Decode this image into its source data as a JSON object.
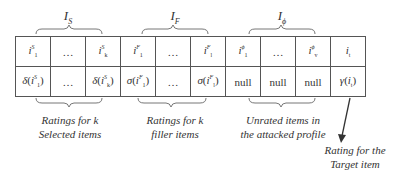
{
  "groups": {
    "selected": {
      "label_main": "I",
      "label_sub": "S"
    },
    "filler": {
      "label_main": "I",
      "label_sub": "F"
    },
    "unrated": {
      "label_main": "I",
      "label_sub": "ϕ"
    }
  },
  "table": {
    "row_items": [
      {
        "main": "i",
        "sup": "S",
        "sub": "1"
      },
      {
        "main": "…"
      },
      {
        "main": "i",
        "sup": "S",
        "sub": "k"
      },
      {
        "main": "i",
        "sup": "F",
        "sub": "1"
      },
      {
        "main": "…"
      },
      {
        "main": "i",
        "sup": "F",
        "sub": "l"
      },
      {
        "main": "i",
        "sup": "ϕ",
        "sub": "1"
      },
      {
        "main": "…"
      },
      {
        "main": "i",
        "sup": "ϕ",
        "sub": "v"
      },
      {
        "main": "i",
        "sub": "t"
      }
    ],
    "row_ratings": [
      {
        "fn": "δ",
        "arg": "i",
        "sup": "S",
        "sub": "1"
      },
      {
        "text": "…"
      },
      {
        "fn": "δ",
        "arg": "i",
        "sup": "S",
        "sub": "k"
      },
      {
        "fn": "σ",
        "arg": "i",
        "sup": "F",
        "sub": "1"
      },
      {
        "text": "…"
      },
      {
        "fn": "σ",
        "arg": "i",
        "sup": "F",
        "sub": "l"
      },
      {
        "text": "null"
      },
      {
        "text": "null"
      },
      {
        "text": "null"
      },
      {
        "fn": "γ",
        "arg": "i",
        "sub": "t"
      }
    ]
  },
  "descriptions": {
    "selected_line1": "Ratings for k",
    "selected_line2": "Selected items",
    "filler_line1": "Ratings for k",
    "filler_line2": "filler items",
    "unrated_line1": "Unrated items in",
    "unrated_line2": "the attacked profile",
    "target_line1": "Rating for the",
    "target_line2": "Target item"
  }
}
